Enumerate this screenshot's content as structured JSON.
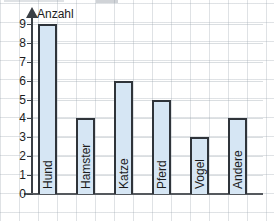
{
  "chart_data": {
    "type": "bar",
    "title": "",
    "subtitle": "",
    "xlabel": "",
    "ylabel": "Anzahl",
    "categories": [
      "Hund",
      "Hamster",
      "Katze",
      "Pferd",
      "Vogel",
      "Andere"
    ],
    "values": [
      9,
      4,
      6,
      5,
      3,
      4
    ],
    "ylim": [
      0,
      9
    ],
    "y_ticks": [
      0,
      1,
      2,
      3,
      4,
      5,
      6,
      7,
      8,
      9
    ],
    "y_tick_labels": [
      "0",
      "1",
      "2",
      "3",
      "4",
      "5",
      "6",
      "7",
      "8",
      "9"
    ],
    "grid": true,
    "legend": false,
    "legend_position": "none",
    "bar_labels_orientation": "vertical",
    "colors": {
      "bar_fill": "#d6e6f4",
      "bar_stroke": "#2f343a",
      "axis": "#3a3f45",
      "grid": "#96a0aa",
      "text": "#1c1c1c",
      "background": "#ffffff"
    }
  },
  "axis": {
    "y_title": "Anzahl"
  }
}
